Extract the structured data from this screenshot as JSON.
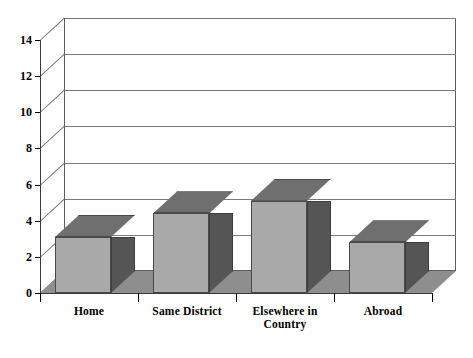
{
  "chart_data": {
    "type": "bar",
    "title": "",
    "subtitle": "",
    "xlabel": "",
    "ylabel": "",
    "categories": [
      "Home",
      "Same District",
      "Elsewhere in Country",
      "Abroad"
    ],
    "category_lines": [
      [
        "Home"
      ],
      [
        "Same District"
      ],
      [
        "Elsewhere in",
        "Country"
      ],
      [
        "Abroad"
      ]
    ],
    "values": [
      3.1,
      4.4,
      5.1,
      2.8
    ],
    "ylim": [
      0,
      14
    ],
    "ytick_labels": [
      "0",
      "2",
      "4",
      "6",
      "8",
      "10",
      "12",
      "14"
    ],
    "ytick_values": [
      0,
      2,
      4,
      6,
      8,
      10,
      12,
      14
    ],
    "grid": true,
    "legend": false,
    "style": "3d-column",
    "colors": {
      "bar_front": "#a9a9a9",
      "bar_top": "#6f6f6f",
      "bar_side": "#555555",
      "floor": "#8e8e8e",
      "wall": "#ffffff",
      "gridline": "#7a7a7a",
      "axis": "#3a3a3a",
      "text": "#000000"
    }
  },
  "axis": {
    "y_ticks": [
      {
        "label": "14",
        "value": 14
      },
      {
        "label": "12",
        "value": 12
      },
      {
        "label": "10",
        "value": 10
      },
      {
        "label": "8",
        "value": 8
      },
      {
        "label": "6",
        "value": 6
      },
      {
        "label": "4",
        "value": 4
      },
      {
        "label": "2",
        "value": 2
      },
      {
        "label": "0",
        "value": 0
      }
    ]
  },
  "bars": [
    {
      "label": "Home",
      "value": 3.1
    },
    {
      "label": "Same District",
      "value": 4.4
    },
    {
      "label": "Elsewhere in Country",
      "value": 5.1
    },
    {
      "label": "Abroad",
      "value": 2.8
    }
  ],
  "x_labels": [
    {
      "line1": "Home",
      "line2": ""
    },
    {
      "line1": "Same District",
      "line2": ""
    },
    {
      "line1": "Elsewhere in",
      "line2": "Country"
    },
    {
      "line1": "Abroad",
      "line2": ""
    }
  ]
}
